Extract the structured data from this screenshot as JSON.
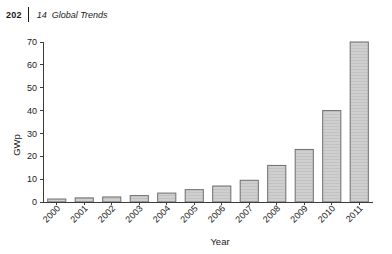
{
  "header": {
    "folio": "202",
    "chapter_number": "14",
    "chapter_title": "Global Trends"
  },
  "chart_data": {
    "type": "bar",
    "title": "",
    "xlabel": "Year",
    "ylabel": "GWp",
    "categories": [
      "2000",
      "2001",
      "2002",
      "2003",
      "2004",
      "2005",
      "2006",
      "2007",
      "2008",
      "2009",
      "2010",
      "2011"
    ],
    "values": [
      1.3,
      1.8,
      2.2,
      2.8,
      3.9,
      5.4,
      7.0,
      9.5,
      16.0,
      23.0,
      40.0,
      70.0
    ],
    "ylim": [
      0,
      70
    ],
    "yticks": [
      0,
      10,
      20,
      30,
      40,
      50,
      60,
      70
    ],
    "ytick_labels": [
      "0",
      "10",
      "20",
      "30",
      "40",
      "50",
      "60",
      "70"
    ],
    "grid": false,
    "legend": "none",
    "bar_fill": "#cfcfcf",
    "bar_stroke": "#6e6e6e",
    "axis_color": "#3c3c3c",
    "xtick_rotation": 45
  }
}
